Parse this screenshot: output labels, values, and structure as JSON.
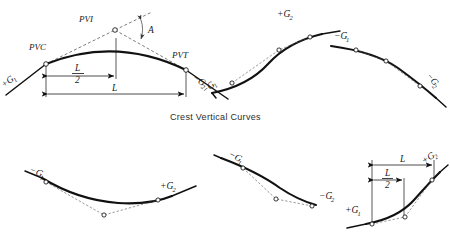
{
  "figure": {
    "caption": "Crest Vertical Curves",
    "background_color": "#ffffff",
    "line_color": "#111111"
  },
  "panels": [
    {
      "id": "crest-main",
      "type": "crest-vertical-curve",
      "description": "Symmetrical crest vertical curve with PVC, PVI, PVT and length dimensions",
      "labels": {
        "pvc": "PVC",
        "pvi": "PVI",
        "pvt": "PVT",
        "grade_in": "+G",
        "grade_in_sub": "1",
        "grade_out": "−G",
        "grade_out_sub": "2",
        "angle": "A",
        "half_length_num": "L",
        "half_length_den": "2",
        "full_length": "L"
      }
    },
    {
      "id": "sag-to-crest-pair",
      "type": "grade-transition-pair",
      "description": "Left: rising curve from minus G1 to plus G2. Right: falling curve from minus G1 to minus G2",
      "labels": {
        "left_grade_in": "−G",
        "left_grade_in_sub": "1",
        "left_grade_out": "+G",
        "left_grade_out_sub": "2",
        "right_grade_in": "−G",
        "right_grade_in_sub": "1",
        "right_grade_out": "−G",
        "right_grade_out_sub": "2"
      }
    },
    {
      "id": "sag-left",
      "type": "sag-vertical-curve",
      "description": "Sag curve from minus G1 to plus G2",
      "labels": {
        "grade_in": "−G",
        "grade_in_sub": "1",
        "grade_out": "+G",
        "grade_out_sub": "2"
      }
    },
    {
      "id": "sag-right-pair",
      "type": "grade-transition-pair",
      "description": "Left: falling curve minus G1 to minus G2. Right: rising sag curve plus G1 to plus G2 with L dimensions",
      "labels": {
        "left_grade_in": "−G",
        "left_grade_in_sub": "1",
        "left_grade_out": "−G",
        "left_grade_out_sub": "2",
        "right_grade_in": "+G",
        "right_grade_in_sub": "1",
        "right_grade_out": "+G",
        "right_grade_out_sub": "2",
        "full_length": "L",
        "half_length_num": "L",
        "half_length_den": "2"
      }
    }
  ]
}
